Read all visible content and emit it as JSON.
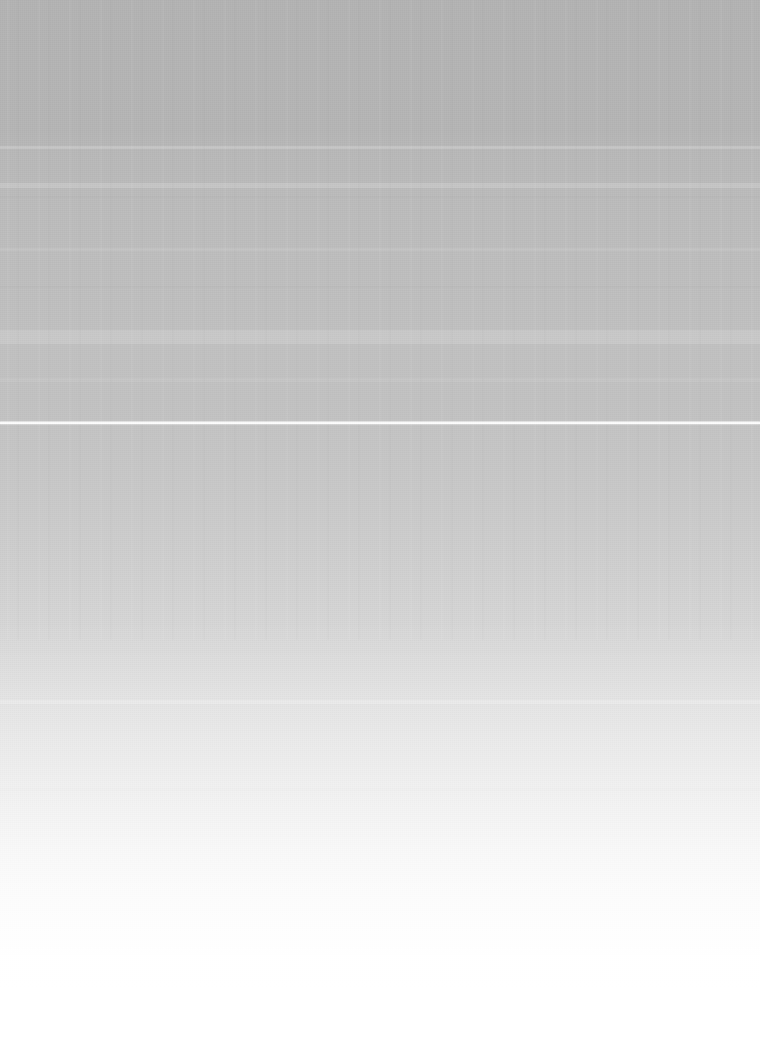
{
  "image": {
    "width": 760,
    "height": 1054,
    "description": "Blank overexposed screenshot: vertical gray-to-white gradient with no legible interface content",
    "legible_text": "",
    "visible_controls": []
  },
  "appearance": {
    "top_plateau_color": "#b3b3b3",
    "mid_color": "#c3c3c3",
    "bottom_color": "#ffffff",
    "rule_color": "#fdfdfd",
    "background_color": "#ffffff"
  },
  "features": {
    "white_rule": {
      "name": "horizontal-rule",
      "y": 422,
      "height": 2,
      "spans_full_width": true
    },
    "bands": [
      {
        "name": "band-upper-1",
        "y": 146,
        "height": 3
      },
      {
        "name": "band-upper-2",
        "y": 183,
        "height": 5
      },
      {
        "name": "band-upper-3",
        "y": 196,
        "height": 2
      },
      {
        "name": "band-upper-4",
        "y": 248,
        "height": 3
      },
      {
        "name": "band-upper-5",
        "y": 286,
        "height": 2
      },
      {
        "name": "band-upper-6",
        "y": 330,
        "height": 14
      },
      {
        "name": "band-upper-7",
        "y": 378,
        "height": 4
      },
      {
        "name": "band-lower-1",
        "y": 700,
        "height": 4
      },
      {
        "name": "band-lower-2",
        "y": 788,
        "height": 3
      }
    ]
  },
  "gradient_stops": [
    {
      "offset_px": 0,
      "color": "#b3b3b3"
    },
    {
      "offset_px": 130,
      "color": "#b5b5b5"
    },
    {
      "offset_px": 190,
      "color": "#bbbbbb"
    },
    {
      "offset_px": 300,
      "color": "#bfbfbf"
    },
    {
      "offset_px": 422,
      "color": "#c3c3c3"
    },
    {
      "offset_px": 570,
      "color": "#d0d0d0"
    },
    {
      "offset_px": 725,
      "color": "#e2e2e2"
    },
    {
      "offset_px": 875,
      "color": "#f4f4f4"
    },
    {
      "offset_px": 985,
      "color": "#ffffff"
    }
  ]
}
